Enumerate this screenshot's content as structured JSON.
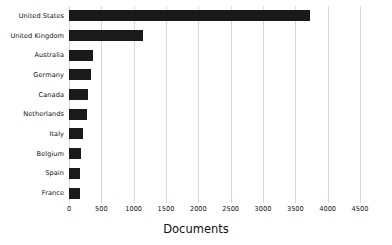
{
  "chart_data": {
    "type": "bar",
    "orientation": "horizontal",
    "title": "",
    "subtitle": "",
    "xlabel": "Documents",
    "ylabel": "",
    "categories": [
      "United States",
      "United Kingdom",
      "Australia",
      "Germany",
      "Canada",
      "Netherlands",
      "Italy",
      "Belgium",
      "Spain",
      "France"
    ],
    "values": [
      3730,
      1150,
      370,
      345,
      290,
      285,
      220,
      180,
      175,
      175
    ],
    "xlim": [
      0,
      4500
    ],
    "xticks": [
      0,
      500,
      1000,
      1500,
      2000,
      2500,
      3000,
      3500,
      4000,
      4500
    ],
    "xtick_labels": [
      "0",
      "500",
      "1000",
      "1500",
      "2000",
      "2500",
      "3000",
      "3500",
      "4000",
      "4500"
    ],
    "grid": "vertical",
    "legend": "none",
    "bar_color": "#1a1a1a",
    "grid_color": "#d9d9d9",
    "background_color": "#ffffff",
    "text_color": "#111111"
  }
}
